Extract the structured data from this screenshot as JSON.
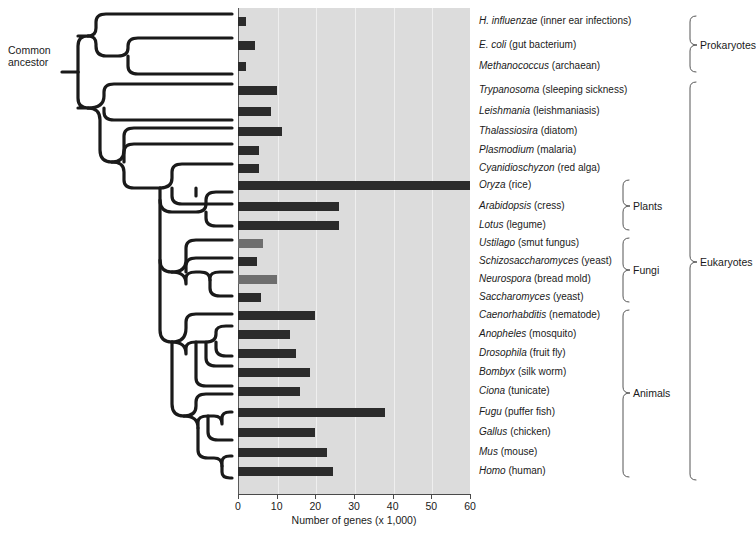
{
  "chart_data": {
    "type": "bar",
    "title": "",
    "xlabel": "Number of genes (x 1,000)",
    "ylabel": "",
    "xlim": [
      0,
      60
    ],
    "xticks": [
      0,
      10,
      20,
      30,
      40,
      50,
      60
    ],
    "xtick_labels": [
      "0",
      "10",
      "20",
      "30",
      "40",
      "50",
      "60"
    ],
    "grid": true,
    "orientation": "horizontal",
    "units": "thousands of genes",
    "categories": [
      "H. influenzae",
      "E. coli",
      "Methanococcus",
      "Trypanosoma",
      "Leishmania",
      "Thalassiosira",
      "Plasmodium",
      "Cyanidioschyzon",
      "Oryza",
      "Arabidopsis",
      "Lotus",
      "Ustilago",
      "Schizosaccharomyces",
      "Neurospora",
      "Saccharomyces",
      "Caenorhabditis",
      "Anopheles",
      "Drosophila",
      "Bombyx",
      "Ciona",
      "Fugu",
      "Gallus",
      "Mus",
      "Homo"
    ],
    "values": [
      2.0,
      4.5,
      2.0,
      10.0,
      8.5,
      11.5,
      5.5,
      5.5,
      60.0,
      26.0,
      26.0,
      6.5,
      5.0,
      10.0,
      6.0,
      20.0,
      13.5,
      15.0,
      18.5,
      16.0,
      38.0,
      20.0,
      23.0,
      24.5
    ]
  },
  "figure": {
    "common_ancestor_label": "Common\nancestor",
    "x_axis_title": "Number of genes (x 1,000)",
    "colors": {
      "panel_background": "#dcdcdc",
      "gridline": "#efefef",
      "bar_dark": "#2b2b2b",
      "bar_light": "#6e6e6e",
      "tree_line": "#1a1a1a",
      "text": "#1a1a1a"
    }
  },
  "taxa": [
    {
      "genus": "H. influenzae",
      "common": "(inner ear infections)",
      "value": 2.0,
      "shade": "dark",
      "y": 21
    },
    {
      "genus": "E. coli",
      "common": "(gut bacterium)",
      "value": 4.5,
      "shade": "dark",
      "y": 45
    },
    {
      "genus": "Methanococcus",
      "common": "(archaean)",
      "value": 2.0,
      "shade": "dark",
      "y": 66
    },
    {
      "genus": "Trypanosoma",
      "common": "(sleeping sickness)",
      "value": 10.0,
      "shade": "dark",
      "y": 90
    },
    {
      "genus": "Leishmania",
      "common": "(leishmaniasis)",
      "value": 8.5,
      "shade": "dark",
      "y": 111
    },
    {
      "genus": "Thalassiosira",
      "common": "(diatom)",
      "value": 11.5,
      "shade": "dark",
      "y": 131
    },
    {
      "genus": "Plasmodium",
      "common": "(malaria)",
      "value": 5.5,
      "shade": "dark",
      "y": 150
    },
    {
      "genus": "Cyanidioschyzon",
      "common": "(red alga)",
      "value": 5.5,
      "shade": "dark",
      "y": 168
    },
    {
      "genus": "Oryza",
      "common": "(rice)",
      "value": 60.0,
      "shade": "dark",
      "y": 185
    },
    {
      "genus": "Arabidopsis",
      "common": "(cress)",
      "value": 26.0,
      "shade": "dark",
      "y": 206
    },
    {
      "genus": "Lotus",
      "common": "(legume)",
      "value": 26.0,
      "shade": "dark",
      "y": 225
    },
    {
      "genus": "Ustilago",
      "common": "(smut fungus)",
      "value": 6.5,
      "shade": "light",
      "y": 243
    },
    {
      "genus": "Schizosaccharomyces",
      "common": "(yeast)",
      "value": 5.0,
      "shade": "dark",
      "y": 261
    },
    {
      "genus": "Neurospora",
      "common": "(bread mold)",
      "value": 10.0,
      "shade": "light",
      "y": 279
    },
    {
      "genus": "Saccharomyces",
      "common": "(yeast)",
      "value": 6.0,
      "shade": "dark",
      "y": 297
    },
    {
      "genus": "Caenorhabditis",
      "common": "(nematode)",
      "value": 20.0,
      "shade": "dark",
      "y": 315
    },
    {
      "genus": "Anopheles",
      "common": "(mosquito)",
      "value": 13.5,
      "shade": "dark",
      "y": 334
    },
    {
      "genus": "Drosophila",
      "common": "(fruit fly)",
      "value": 15.0,
      "shade": "dark",
      "y": 353
    },
    {
      "genus": "Bombyx",
      "common": "(silk worm)",
      "value": 18.5,
      "shade": "dark",
      "y": 372
    },
    {
      "genus": "Ciona",
      "common": "(tunicate)",
      "value": 16.0,
      "shade": "dark",
      "y": 391
    },
    {
      "genus": "Fugu",
      "common": "(puffer fish)",
      "value": 38.0,
      "shade": "dark",
      "y": 412
    },
    {
      "genus": "Gallus",
      "common": "(chicken)",
      "value": 20.0,
      "shade": "dark",
      "y": 432
    },
    {
      "genus": "Mus",
      "common": "(mouse)",
      "value": 23.0,
      "shade": "dark",
      "y": 452
    },
    {
      "genus": "Homo",
      "common": "(human)",
      "value": 24.5,
      "shade": "dark",
      "y": 471
    }
  ],
  "groups": [
    {
      "label": "Prokaryotes",
      "level": 2,
      "x": 700,
      "y": 45,
      "top": 16,
      "bottom": 72
    },
    {
      "label": "Plants",
      "level": 1,
      "x": 633,
      "y": 206,
      "top": 180,
      "bottom": 230
    },
    {
      "label": "Fungi",
      "level": 1,
      "x": 633,
      "y": 270,
      "top": 238,
      "bottom": 302
    },
    {
      "label": "Animals",
      "level": 1,
      "x": 633,
      "y": 393,
      "top": 310,
      "bottom": 477
    },
    {
      "label": "Eukaryotes",
      "level": 2,
      "x": 700,
      "y": 262,
      "top": 82,
      "bottom": 480
    }
  ]
}
